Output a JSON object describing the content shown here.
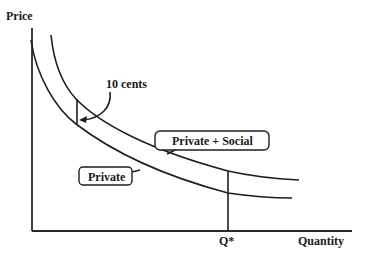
{
  "diagram": {
    "type": "economics supply/cost curves",
    "axes": {
      "y_label": "Price",
      "x_label": "Quantity",
      "x_marker": "Q*"
    },
    "curves": [
      {
        "name": "Private",
        "label": "Private"
      },
      {
        "name": "Private + Social",
        "label": "Private + Social"
      }
    ],
    "annotations": {
      "gap_label": "10 cents"
    },
    "colors": {
      "line": "#1e1e1e",
      "background": "#ffffff"
    }
  }
}
